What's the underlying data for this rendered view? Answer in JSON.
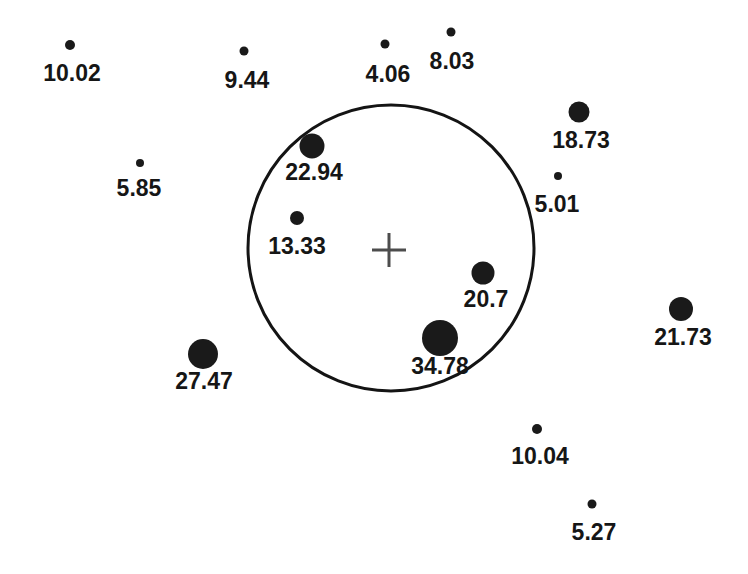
{
  "figure": {
    "width": 748,
    "height": 574,
    "background": "#ffffff",
    "dot_color": "#1a1a1a",
    "label_color": "#161616",
    "label_font_size": 23,
    "circle_stroke_color": "#141414",
    "circle_stroke_width": 3,
    "cross_stroke_color": "#4d4d4d",
    "cross_stroke_width": 3
  },
  "chart_data": {
    "type": "scatter",
    "title": "",
    "xlabel": "",
    "ylabel": "",
    "axes_visible": false,
    "grid": false,
    "legend": false,
    "units": "pixels",
    "points": [
      {
        "label": "10.02",
        "value": 10.02,
        "x": 70,
        "y": 45,
        "diameter": 10,
        "label_x": 72,
        "label_y": 73
      },
      {
        "label": "9.44",
        "value": 9.44,
        "x": 244,
        "y": 51,
        "diameter": 9,
        "label_x": 247,
        "label_y": 80
      },
      {
        "label": "4.06",
        "value": 4.06,
        "x": 385,
        "y": 44,
        "diameter": 9,
        "label_x": 388,
        "label_y": 74
      },
      {
        "label": "8.03",
        "value": 8.03,
        "x": 451,
        "y": 32,
        "diameter": 9,
        "label_x": 452,
        "label_y": 61
      },
      {
        "label": "18.73",
        "value": 18.73,
        "x": 579,
        "y": 112,
        "diameter": 21,
        "label_x": 581,
        "label_y": 140
      },
      {
        "label": "5.85",
        "value": 5.85,
        "x": 140,
        "y": 163,
        "diameter": 8,
        "label_x": 139,
        "label_y": 188
      },
      {
        "label": "22.94",
        "value": 22.94,
        "x": 312,
        "y": 146,
        "diameter": 25,
        "label_x": 314,
        "label_y": 172
      },
      {
        "label": "5.01",
        "value": 5.01,
        "x": 558,
        "y": 176,
        "diameter": 8,
        "label_x": 557,
        "label_y": 204
      },
      {
        "label": "13.33",
        "value": 13.33,
        "x": 297,
        "y": 218,
        "diameter": 14,
        "label_x": 297,
        "label_y": 246
      },
      {
        "label": "20.7",
        "value": 20.7,
        "x": 483,
        "y": 273,
        "diameter": 23,
        "label_x": 486,
        "label_y": 299
      },
      {
        "label": "34.78",
        "value": 34.78,
        "x": 440,
        "y": 338,
        "diameter": 36,
        "label_x": 440,
        "label_y": 366
      },
      {
        "label": "21.73",
        "value": 21.73,
        "x": 681,
        "y": 309,
        "diameter": 24,
        "label_x": 683,
        "label_y": 337
      },
      {
        "label": "27.47",
        "value": 27.47,
        "x": 203,
        "y": 354,
        "diameter": 30,
        "label_x": 204,
        "label_y": 381
      },
      {
        "label": "10.04",
        "value": 10.04,
        "x": 537,
        "y": 429,
        "diameter": 10,
        "label_x": 540,
        "label_y": 456
      },
      {
        "label": "5.27",
        "value": 5.27,
        "x": 592,
        "y": 504,
        "diameter": 9,
        "label_x": 594,
        "label_y": 532
      }
    ],
    "reference_circle": {
      "cx": 391,
      "cy": 248,
      "r": 143
    },
    "center_cross": {
      "x": 389,
      "y": 250,
      "half_arm": 17
    }
  }
}
